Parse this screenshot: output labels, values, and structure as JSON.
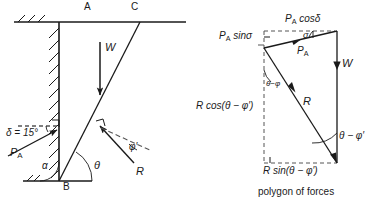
{
  "figure": {
    "caption": "polygon of forces",
    "colors": {
      "line": "#1a1a1a",
      "dashed": "#555555",
      "background": "#ffffff"
    }
  },
  "wall_diagram": {
    "points": {
      "A": "A",
      "B": "B",
      "C": "C"
    },
    "labels": {
      "weight": "W",
      "active_thrust": "P",
      "active_thrust_sub": "A",
      "reaction": "R",
      "wall_friction": "δ = 15°",
      "alpha": "α",
      "theta": "θ",
      "phi_prime": "φ′"
    }
  },
  "polygon": {
    "labels": {
      "pa_cos_delta": "P",
      "pa_cos_delta_sub": "A",
      "pa_cos_delta_rest": " cosδ",
      "pa_sin_delta": "P",
      "pa_sin_delta_sub": "A",
      "pa_sin_delta_rest": " sinσ",
      "pa": "P",
      "pa_sub": "A",
      "sigma": "σ",
      "weight": "W",
      "reaction": "R",
      "theta_minus_phi": "θ−φ",
      "theta_minus_phi_prime": "θ − φ′",
      "r_cos": "R cos(θ − φ′)",
      "r_sin": "R sin(θ − φ′)"
    }
  }
}
